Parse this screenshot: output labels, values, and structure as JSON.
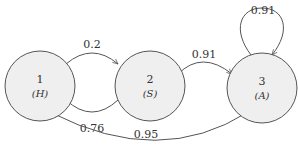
{
  "diagram": {
    "type": "state-transition",
    "nodes": [
      {
        "id": "1",
        "number": "1",
        "label": "(H)"
      },
      {
        "id": "2",
        "number": "2",
        "label": "(S)"
      },
      {
        "id": "3",
        "number": "3",
        "label": "(A)"
      }
    ],
    "edges": [
      {
        "from": "1",
        "to": "2",
        "weight": "0.2"
      },
      {
        "from": "2",
        "to": "1",
        "weight": "0.76"
      },
      {
        "from": "2",
        "to": "3",
        "weight": "0.91"
      },
      {
        "from": "3",
        "to": "3",
        "weight": "0.91"
      },
      {
        "from": "3",
        "to": "1",
        "weight": "0.95"
      }
    ]
  }
}
